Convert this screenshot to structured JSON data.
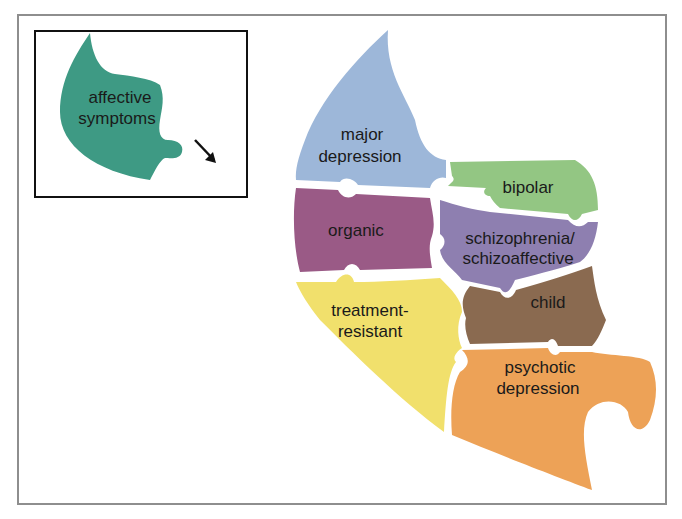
{
  "inset": {
    "label_line1": "affective",
    "label_line2": "symptoms",
    "color": "#3e9a84",
    "arrow": "arrow-down-right-icon"
  },
  "pieces": [
    {
      "id": "major-depression",
      "line1": "major",
      "line2": "depression",
      "color": "#9db7d9"
    },
    {
      "id": "bipolar",
      "line1": "bipolar",
      "line2": "",
      "color": "#93c683"
    },
    {
      "id": "organic",
      "line1": "organic",
      "line2": "",
      "color": "#9a5a86"
    },
    {
      "id": "schizophrenia",
      "line1": "schizophrenia/",
      "line2": "schizoaffective",
      "color": "#8e7fb0"
    },
    {
      "id": "treatment-resistant",
      "line1": "treatment-",
      "line2": "resistant",
      "color": "#f1e06c"
    },
    {
      "id": "child",
      "line1": "child",
      "line2": "",
      "color": "#8a6a50"
    },
    {
      "id": "psychotic-depression",
      "line1": "psychotic",
      "line2": "depression",
      "color": "#eda257"
    }
  ]
}
